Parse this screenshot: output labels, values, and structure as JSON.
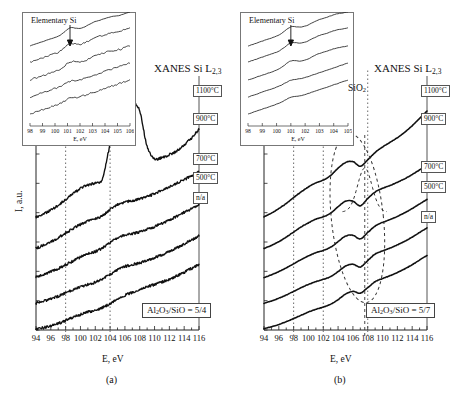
{
  "figure": {
    "ylabel": "I, a.u.",
    "xlabel": "E, eV"
  },
  "panels": [
    {
      "id": "a",
      "caption": "(a)",
      "plot_title": "XANES Si L",
      "plot_title_sub": "2,3",
      "composition_label": "Al",
      "composition": {
        "pre": "Al",
        "sub1": "2",
        "mid": "O",
        "sub2": "3",
        "post": "/SiO = 5/4"
      },
      "composition_text": "Al2O3/SiO = 5/4",
      "series_labels": [
        "1100°C",
        "900°C",
        "700°C",
        "500°C",
        "n/a"
      ],
      "xaxis": {
        "label": "E, eV",
        "min": 94,
        "max": 116,
        "ticks": [
          94,
          96,
          98,
          100,
          102,
          104,
          106,
          108,
          110,
          112,
          114,
          116
        ],
        "minor_step": 1
      },
      "guides_eV": [
        98,
        104
      ],
      "inset": {
        "annotation": "Elementary Si",
        "xlabel": "E, eV",
        "xmin": 98,
        "xmax": 106,
        "ticks": [
          98,
          99,
          100,
          101,
          102,
          103,
          104,
          105,
          106
        ],
        "arrow_at_eV": 101.2
      }
    },
    {
      "id": "b",
      "caption": "(b)",
      "plot_title": "XANES Si L",
      "plot_title_sub": "2,3",
      "composition": {
        "pre": "Al",
        "sub1": "2",
        "mid": "O",
        "sub2": "3",
        "post": "/SiO = 5/7"
      },
      "composition_text": "Al2O3/SiO = 5/7",
      "series_labels": [
        "1100°C",
        "900°C",
        "700°C",
        "500°C",
        "n/a"
      ],
      "annotation_sio2": {
        "pre": "SiO",
        "sub": "2"
      },
      "annotation_sio2_text": "SiO2",
      "xaxis": {
        "label": "E, eV",
        "min": 94,
        "max": 116,
        "ticks": [
          94,
          96,
          98,
          100,
          102,
          104,
          106,
          108,
          110,
          112,
          114,
          116
        ],
        "minor_step": 1
      },
      "guides_eV": [
        98,
        102,
        108
      ],
      "inset": {
        "annotation": "Elementary Si",
        "xlabel": "E, eV",
        "xmin": 98,
        "xmax": 105,
        "ticks": [
          98,
          99,
          100,
          101,
          102,
          103,
          104,
          105
        ],
        "arrow_at_eV": 101.0
      }
    }
  ],
  "chart_data": {
    "type": "line",
    "title": "XANES Si L2,3",
    "xlabel": "E, eV",
    "ylabel": "I, a.u.",
    "xlim": [
      94,
      116
    ],
    "grid": false,
    "legend_position": "right-stacked-labels",
    "panels": [
      {
        "id": "a",
        "composition": "Al2O3/SiO = 5/4",
        "note": "curves are noisy/dotted; offset vertically, bottom = n/a, top = 1100 C",
        "series": [
          {
            "name": "n/a",
            "offset": 0,
            "x": [
              94,
              95,
              96,
              97,
              98,
              99,
              100,
              101,
              102,
              103,
              104,
              105,
              106,
              107,
              108,
              109,
              110,
              111,
              112,
              113,
              114,
              115,
              116
            ],
            "y": [
              0.02,
              0.05,
              0.09,
              0.14,
              0.2,
              0.27,
              0.33,
              0.38,
              0.42,
              0.48,
              0.56,
              0.66,
              0.74,
              0.8,
              0.86,
              0.92,
              0.97,
              1.02,
              1.08,
              1.15,
              1.23,
              1.31,
              1.4
            ]
          },
          {
            "name": "500°C",
            "offset": 0.55,
            "x": [
              94,
              95,
              96,
              97,
              98,
              99,
              100,
              101,
              102,
              103,
              104,
              105,
              106,
              107,
              108,
              109,
              110,
              111,
              112,
              113,
              114,
              115,
              116
            ],
            "y": [
              0.02,
              0.06,
              0.11,
              0.17,
              0.24,
              0.31,
              0.37,
              0.42,
              0.47,
              0.54,
              0.63,
              0.73,
              0.8,
              0.84,
              0.88,
              0.93,
              0.99,
              1.05,
              1.12,
              1.2,
              1.28,
              1.36,
              1.45
            ]
          },
          {
            "name": "700°C",
            "offset": 1.1,
            "x": [
              94,
              95,
              96,
              97,
              98,
              99,
              100,
              101,
              102,
              103,
              104,
              105,
              106,
              107,
              108,
              109,
              110,
              111,
              112,
              113,
              114,
              115,
              116
            ],
            "y": [
              0.03,
              0.08,
              0.14,
              0.21,
              0.29,
              0.37,
              0.45,
              0.52,
              0.57,
              0.65,
              0.76,
              0.86,
              0.92,
              0.95,
              0.99,
              1.04,
              1.1,
              1.17,
              1.24,
              1.32,
              1.4,
              1.48,
              1.56
            ]
          },
          {
            "name": "900°C",
            "offset": 1.7,
            "x": [
              94,
              95,
              96,
              97,
              98,
              99,
              100,
              101,
              102,
              103,
              104,
              105,
              106,
              107,
              108,
              109,
              110,
              111,
              112,
              113,
              114,
              115,
              116
            ],
            "y": [
              0.04,
              0.1,
              0.17,
              0.26,
              0.36,
              0.46,
              0.55,
              0.62,
              0.66,
              0.74,
              0.86,
              0.96,
              1.02,
              1.05,
              1.09,
              1.14,
              1.2,
              1.27,
              1.34,
              1.42,
              1.5,
              1.58,
              1.66
            ]
          },
          {
            "name": "1100°C",
            "offset": 2.35,
            "x": [
              94,
              95,
              96,
              97,
              98,
              99,
              100,
              101,
              102,
              103,
              104,
              105,
              106,
              107,
              108,
              109,
              110,
              111,
              112,
              113,
              114,
              115,
              116
            ],
            "y": [
              0.05,
              0.12,
              0.2,
              0.3,
              0.42,
              0.55,
              0.66,
              0.74,
              0.78,
              0.88,
              1.6,
              2.05,
              1.85,
              2.45,
              2.3,
              1.55,
              1.3,
              1.32,
              1.38,
              1.46,
              1.58,
              1.74,
              1.92
            ],
            "note": "strong sharp peaks near 104-108 eV (elementary Si / SiO2 mix)"
          }
        ]
      },
      {
        "id": "b",
        "composition": "Al2O3/SiO = 5/7",
        "note": "smooth curves; dashed ellipse highlights SiO2 feature near 106-108 eV",
        "annotations": [
          {
            "text": "SiO2",
            "x": 107.5,
            "type": "dashed-gaussian-overlay"
          },
          {
            "text": "",
            "x": 106.5,
            "type": "dashed-ellipse"
          }
        ],
        "series": [
          {
            "name": "n/a",
            "offset": 0,
            "x": [
              94,
              95,
              96,
              97,
              98,
              99,
              100,
              101,
              102,
              103,
              104,
              105,
              106,
              107,
              108,
              109,
              110,
              111,
              112,
              113,
              114,
              115,
              116
            ],
            "y": [
              0.03,
              0.07,
              0.12,
              0.18,
              0.25,
              0.32,
              0.39,
              0.45,
              0.5,
              0.56,
              0.66,
              0.78,
              0.84,
              0.8,
              0.92,
              1.05,
              1.12,
              1.18,
              1.25,
              1.33,
              1.42,
              1.52,
              1.62
            ]
          },
          {
            "name": "500°C",
            "offset": 0.55,
            "x": [
              94,
              95,
              96,
              97,
              98,
              99,
              100,
              101,
              102,
              103,
              104,
              105,
              106,
              107,
              108,
              109,
              110,
              111,
              112,
              113,
              114,
              115,
              116
            ],
            "y": [
              0.03,
              0.08,
              0.14,
              0.21,
              0.29,
              0.37,
              0.44,
              0.5,
              0.55,
              0.61,
              0.72,
              0.84,
              0.88,
              0.82,
              0.96,
              1.1,
              1.17,
              1.23,
              1.3,
              1.38,
              1.47,
              1.57,
              1.67
            ]
          },
          {
            "name": "700°C",
            "offset": 1.1,
            "x": [
              94,
              95,
              96,
              97,
              98,
              99,
              100,
              101,
              102,
              103,
              104,
              105,
              106,
              107,
              108,
              109,
              110,
              111,
              112,
              113,
              114,
              115,
              116
            ],
            "y": [
              0.04,
              0.1,
              0.17,
              0.25,
              0.34,
              0.43,
              0.51,
              0.58,
              0.63,
              0.7,
              0.82,
              0.94,
              0.96,
              0.88,
              1.02,
              1.16,
              1.24,
              1.3,
              1.37,
              1.45,
              1.54,
              1.64,
              1.74
            ]
          },
          {
            "name": "900°C",
            "offset": 1.72,
            "x": [
              94,
              95,
              96,
              97,
              98,
              99,
              100,
              101,
              102,
              103,
              104,
              105,
              106,
              107,
              108,
              109,
              110,
              111,
              112,
              113,
              114,
              115,
              116
            ],
            "y": [
              0.05,
              0.12,
              0.2,
              0.3,
              0.41,
              0.52,
              0.61,
              0.69,
              0.74,
              0.82,
              0.96,
              1.08,
              1.08,
              0.98,
              1.14,
              1.28,
              1.36,
              1.42,
              1.49,
              1.57,
              1.66,
              1.76,
              1.86
            ]
          },
          {
            "name": "1100°C",
            "offset": 2.4,
            "x": [
              94,
              95,
              96,
              97,
              98,
              99,
              100,
              101,
              102,
              103,
              104,
              105,
              106,
              107,
              108,
              109,
              110,
              111,
              112,
              113,
              114,
              115,
              116
            ],
            "y": [
              0.06,
              0.14,
              0.24,
              0.35,
              0.48,
              0.6,
              0.71,
              0.8,
              0.86,
              0.96,
              1.12,
              1.24,
              1.26,
              1.16,
              1.3,
              1.46,
              1.58,
              1.68,
              1.78,
              1.9,
              2.04,
              2.2,
              2.36
            ]
          }
        ]
      }
    ],
    "insets": [
      {
        "panel": "a",
        "xlim": [
          98,
          106
        ],
        "annotation": "Elementary Si",
        "xlabel": "E, eV",
        "n_series": 5
      },
      {
        "panel": "b",
        "xlim": [
          98,
          105
        ],
        "annotation": "Elementary Si",
        "xlabel": "E, eV",
        "n_series": 5
      }
    ]
  }
}
